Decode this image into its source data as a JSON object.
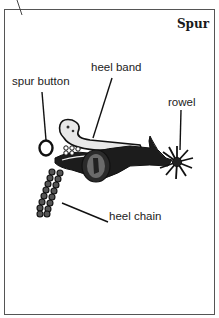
{
  "figure": {
    "title": "Spur",
    "labels": [
      {
        "id": "heel-band",
        "text": "heel band"
      },
      {
        "id": "spur-button",
        "text": "spur button"
      },
      {
        "id": "rowel",
        "text": "rowel"
      },
      {
        "id": "heel-chain",
        "text": "heel chain"
      }
    ]
  },
  "colors": {
    "ink": "#1a1a1a",
    "border": "#555555",
    "background": "#ffffff"
  }
}
